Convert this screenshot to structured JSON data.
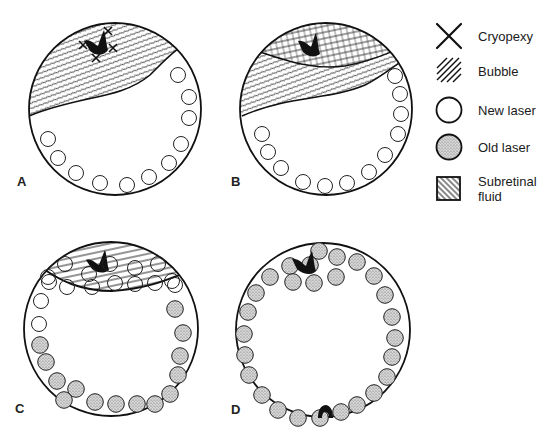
{
  "figure": {
    "panels": [
      {
        "id": "A",
        "label": "A",
        "cx": 115,
        "cy": 109,
        "r": 86,
        "description": "Superior tear with cryopexy; bubble and subretinal fluid superiorly; new laser spots inferiorly",
        "new_laser": [
          [
            178,
            75
          ],
          [
            189,
            97
          ],
          [
            189,
            118
          ],
          [
            181,
            144
          ],
          [
            169,
            163
          ],
          [
            149,
            177
          ],
          [
            127,
            185
          ],
          [
            100,
            183
          ],
          [
            76,
            173
          ],
          [
            58,
            158
          ],
          [
            48,
            139
          ]
        ],
        "old_laser": [],
        "cryopexy": [
          [
            108,
            31
          ],
          [
            83,
            45
          ],
          [
            113,
            48
          ],
          [
            96,
            58
          ]
        ],
        "tear": [
          96,
          47
        ]
      },
      {
        "id": "B",
        "label": "B",
        "cx": 326,
        "cy": 109,
        "r": 86,
        "description": "Bubble tamponading tear superiorly, fluid displaced inferiorly; new laser inferiorly",
        "new_laser": [
          [
            395,
            76
          ],
          [
            400,
            94
          ],
          [
            401,
            114
          ],
          [
            398,
            134
          ],
          [
            385,
            155
          ],
          [
            369,
            172
          ],
          [
            347,
            183
          ],
          [
            325,
            186
          ],
          [
            303,
            182
          ],
          [
            281,
            168
          ],
          [
            268,
            152
          ],
          [
            262,
            134
          ]
        ],
        "old_laser": [],
        "tear": [
          311,
          47
        ]
      },
      {
        "id": "C",
        "label": "C",
        "cx": 111,
        "cy": 329,
        "r": 87,
        "description": "Bubble over tear; new laser ring behind bubble and along upper sides; old laser inferiorly",
        "new_laser": [
          [
            65,
            264
          ],
          [
            89,
            274
          ],
          [
            110,
            264
          ],
          [
            135,
            268
          ],
          [
            158,
            264
          ],
          [
            67,
            287
          ],
          [
            92,
            287
          ],
          [
            115,
            283
          ],
          [
            135,
            284
          ],
          [
            155,
            283
          ],
          [
            49,
            282
          ],
          [
            172,
            281
          ],
          [
            41,
            301
          ],
          [
            39,
            324
          ],
          [
            48,
            277
          ],
          [
            175,
            285
          ]
        ],
        "old_laser": [
          [
            175,
            309
          ],
          [
            183,
            333
          ],
          [
            180,
            356
          ],
          [
            178,
            375
          ],
          [
            170,
            394
          ],
          [
            155,
            404
          ],
          [
            137,
            404
          ],
          [
            116,
            404
          ],
          [
            95,
            402
          ],
          [
            76,
            389
          ],
          [
            57,
            381
          ],
          [
            46,
            362
          ],
          [
            40,
            345
          ],
          [
            64,
            400
          ]
        ],
        "tear": [
          99,
          257
        ]
      },
      {
        "id": "D",
        "label": "D",
        "cx": 323,
        "cy": 330,
        "r": 87,
        "description": "Complete 360-degree ring of old laser; second break inferiorly",
        "old_laser": [
          [
            319,
            251
          ],
          [
            337,
            257
          ],
          [
            357,
            262
          ],
          [
            374,
            276
          ],
          [
            385,
            295
          ],
          [
            392,
            317
          ],
          [
            395,
            338
          ],
          [
            392,
            357
          ],
          [
            387,
            377
          ],
          [
            374,
            393
          ],
          [
            357,
            405
          ],
          [
            341,
            412
          ],
          [
            320,
            418
          ],
          [
            298,
            418
          ],
          [
            278,
            410
          ],
          [
            262,
            395
          ],
          [
            249,
            375
          ],
          [
            245,
            355
          ],
          [
            244,
            334
          ],
          [
            248,
            312
          ],
          [
            256,
            293
          ],
          [
            270,
            277
          ],
          [
            290,
            266
          ],
          [
            310,
            265
          ],
          [
            336,
            277
          ],
          [
            314,
            283
          ],
          [
            293,
            282
          ]
        ],
        "new_laser": [],
        "tear": [
          305,
          263
        ],
        "second_break": [
          324,
          414
        ]
      }
    ]
  },
  "legend": {
    "items": [
      {
        "key": "cryopexy",
        "label": "Cryopexy",
        "icon": "x-cross-icon",
        "y": 36
      },
      {
        "key": "bubble",
        "label": "Bubble",
        "icon": "diagonal-hatch-icon",
        "y": 71
      },
      {
        "key": "new_laser",
        "label": "New laser",
        "icon": "open-circle-icon",
        "y": 110
      },
      {
        "key": "old_laser",
        "label": "Old laser",
        "icon": "stippled-circle-icon",
        "y": 147
      },
      {
        "key": "subretinal_fluid",
        "label": "Subretinal",
        "label2": "fluid",
        "icon": "hatched-square-icon",
        "y": 189
      }
    ]
  },
  "colors": {
    "ink": "#111111",
    "stipple": "#9a9a9a",
    "stipple_bg": "#d6d6d6",
    "paper": "#ffffff"
  }
}
